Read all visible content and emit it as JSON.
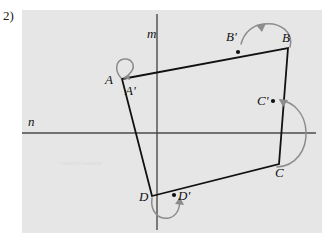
{
  "problem": {
    "number_label": "2)"
  },
  "figure": {
    "panel_background": "#e6e6e6",
    "axes": [
      {
        "name": "m",
        "label": "m",
        "orientation": "vertical",
        "x": 157
      },
      {
        "name": "n",
        "label": "n",
        "orientation": "horizontal",
        "y": 133
      }
    ],
    "axis_labels": {
      "m": "m",
      "n": "n"
    },
    "preimage": {
      "name": "quadrilateral-ABCD",
      "vertices": [
        {
          "label": "A",
          "x": 122,
          "y": 79
        },
        {
          "label": "B",
          "x": 288,
          "y": 48
        },
        {
          "label": "C",
          "x": 279,
          "y": 164
        },
        {
          "label": "D",
          "x": 152,
          "y": 196
        }
      ]
    },
    "image_points": [
      {
        "label": "A'",
        "x": 124,
        "y": 82
      },
      {
        "label": "B'",
        "x": 238,
        "y": 52
      },
      {
        "label": "C'",
        "x": 273,
        "y": 101
      },
      {
        "label": "D'",
        "x": 178,
        "y": 196
      }
    ],
    "colors": {
      "panel": "#e6e6e6",
      "edge": "#111111",
      "axis": "#4a4a4a",
      "arrow": "#8c8c8c",
      "label": "#111111"
    },
    "watermark": "transformations"
  }
}
